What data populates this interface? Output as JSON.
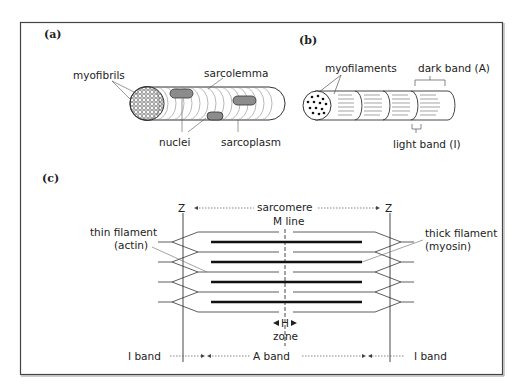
{
  "figure": {
    "panels": [
      {
        "id": "a",
        "label": "(a)",
        "labels": {
          "myofibrils": "myofibrils",
          "sarcolemma": "sarcolemma",
          "nuclei": "nuclei",
          "sarcoplasm": "sarcoplasm"
        }
      },
      {
        "id": "b",
        "label": "(b)",
        "labels": {
          "myofilaments": "myofilaments",
          "dark_band": "dark band (A)",
          "light_band": "light band (I)"
        }
      },
      {
        "id": "c",
        "label": "(c)",
        "labels": {
          "z_left": "Z",
          "z_right": "Z",
          "sarcomere": "sarcomere",
          "m_line": "M line",
          "thin_filament_line1": "thin filament",
          "thin_filament_line2": "(actin)",
          "thick_filament_line1": "thick filament",
          "thick_filament_line2": "(myosin)",
          "h": "H",
          "zone": "zone",
          "i_band_left": "I band",
          "a_band": "A band",
          "i_band_right": "I band"
        }
      }
    ],
    "colors": {
      "line": "#2a2a2a",
      "nucleus_fill": "#8c8c8c",
      "frame": "#444444",
      "background": "#ffffff"
    }
  }
}
